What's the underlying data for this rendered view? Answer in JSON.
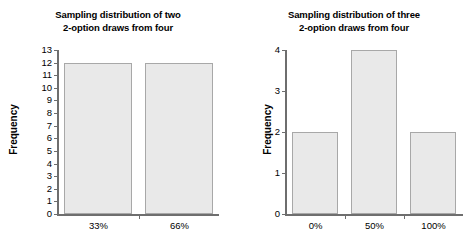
{
  "figure": {
    "background": "#ffffff",
    "bar_fill": "#e9e9e9",
    "bar_border": "#a8a8a8",
    "axis_color": "#6e6e6e",
    "text_color": "#000000"
  },
  "chart_data": [
    {
      "type": "bar",
      "id": "left",
      "title": "Sampling distribution of two 2-option draws from four",
      "title_line1": "Sampling distribution of two",
      "title_line2": "2-option draws from four",
      "xlabel": "",
      "ylabel": "Frequency",
      "categories": [
        "33%",
        "66%"
      ],
      "values": [
        12,
        12
      ],
      "ylim": [
        0,
        13
      ],
      "yticks": [
        13,
        12,
        11,
        10,
        9,
        8,
        7,
        6,
        5,
        4,
        3,
        2,
        1,
        0
      ],
      "grid": false,
      "legend": "none"
    },
    {
      "type": "bar",
      "id": "right",
      "title": "Sampling distribution of three 2-option draws from four",
      "title_line1": "Sampling distribution of three",
      "title_line2": "2-option draws from four",
      "xlabel": "",
      "ylabel": "Frequency",
      "categories": [
        "0%",
        "50%",
        "100%"
      ],
      "values": [
        2,
        4,
        2
      ],
      "ylim": [
        0,
        4
      ],
      "yticks": [
        4,
        3,
        2,
        1,
        0
      ],
      "grid": false,
      "legend": "none"
    }
  ]
}
